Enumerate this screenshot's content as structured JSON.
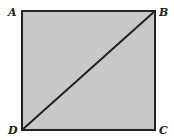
{
  "diagram": {
    "title": "",
    "shape": "square",
    "fill_color": "#c8c8c8",
    "stroke_color": "#222222",
    "vertices": [
      {
        "label": "A",
        "x": 22,
        "y": 11,
        "position": "top-left"
      },
      {
        "label": "B",
        "x": 155,
        "y": 11,
        "position": "top-right"
      },
      {
        "label": "C",
        "x": 155,
        "y": 130,
        "position": "bottom-right"
      },
      {
        "label": "D",
        "x": 22,
        "y": 130,
        "position": "bottom-left"
      }
    ],
    "diagonal": {
      "from": "D",
      "to": "B"
    }
  }
}
